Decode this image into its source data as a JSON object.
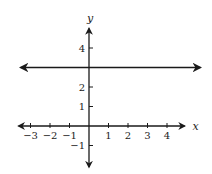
{
  "chart_data": {
    "type": "line",
    "title": "",
    "xlabel": "x",
    "ylabel": "y",
    "xlim": [
      -3.5,
      4.9
    ],
    "ylim": [
      -1.9,
      5.2
    ],
    "x_ticks": [
      -3,
      -2,
      -1,
      1,
      2,
      3,
      4
    ],
    "x_tick_labels": [
      "−3",
      "−2",
      "−1",
      "1",
      "2",
      "3",
      "4"
    ],
    "y_ticks": [
      -1,
      1,
      2,
      4
    ],
    "y_tick_labels": [
      "−1",
      "1",
      "2",
      "4"
    ],
    "grid": false,
    "series": [
      {
        "name": "y = 3",
        "type": "horizontal-line",
        "y": 3,
        "x_range": [
          -3.6,
          5.5
        ],
        "arrows": "both"
      }
    ]
  }
}
